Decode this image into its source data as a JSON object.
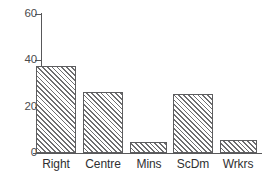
{
  "chart_data": {
    "type": "bar",
    "title": "",
    "subtitle": "",
    "xlabel": "",
    "ylabel": "",
    "categories": [
      "Right",
      "Centre",
      "Mins",
      "ScDm",
      "Wrkrs"
    ],
    "values": [
      37.5,
      26.5,
      4.7,
      25.5,
      5.6
    ],
    "series": [
      {
        "name": "",
        "values": [
          37.5,
          26.5,
          4.7,
          25.5,
          5.6
        ]
      }
    ],
    "ylim": [
      0,
      60
    ],
    "yticks": [
      0,
      20,
      40,
      60
    ],
    "ytick_labels": [
      "0",
      "20",
      "40",
      "60"
    ],
    "xtick_labels": [
      "Right",
      "Centre",
      "Mins",
      "ScDm",
      "Wrkrs"
    ],
    "grid": false,
    "legend": false,
    "legend_position": "none",
    "annotations": [],
    "bar_fill": "hatched-diagonal",
    "bar_edge_color": "#5d5d5f",
    "hatch_color": "#6e6e70",
    "axis_color": "#58585a",
    "background_color": "#ffffff"
  },
  "axis": {
    "y_tick_0": "0",
    "y_tick_1": "20",
    "y_tick_2": "40",
    "y_tick_3": "60"
  },
  "bars": [
    {
      "label": "Right",
      "value": 37.5
    },
    {
      "label": "Centre",
      "value": 26.5
    },
    {
      "label": "Mins",
      "value": 4.7
    },
    {
      "label": "ScDm",
      "value": 25.5
    },
    {
      "label": "Wrkrs",
      "value": 5.6
    }
  ]
}
